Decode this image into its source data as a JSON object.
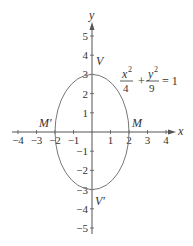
{
  "axes": {
    "x_label": "x",
    "y_label": "y",
    "x_ticks": [
      {
        "value": -4,
        "label": "−4"
      },
      {
        "value": -3,
        "label": "−3"
      },
      {
        "value": -2,
        "label": "−2"
      },
      {
        "value": -1,
        "label": "−1"
      },
      {
        "value": 1,
        "label": "1"
      },
      {
        "value": 2,
        "label": "2"
      },
      {
        "value": 3,
        "label": "3"
      },
      {
        "value": 4,
        "label": "4"
      }
    ],
    "y_ticks": [
      {
        "value": 5,
        "label": "5"
      },
      {
        "value": 4,
        "label": "4"
      },
      {
        "value": 3,
        "label": "3"
      },
      {
        "value": 2,
        "label": "2"
      },
      {
        "value": 1,
        "label": "1"
      },
      {
        "value": -1,
        "label": "−1"
      },
      {
        "value": -2,
        "label": "−2"
      },
      {
        "value": -3,
        "label": "−3"
      },
      {
        "value": -4,
        "label": "−4"
      },
      {
        "value": -5,
        "label": "−5"
      }
    ]
  },
  "ellipse": {
    "a": 2,
    "b": 3,
    "equation": {
      "x_num": "x",
      "x_den": "4",
      "plus": "+",
      "y_num": "y",
      "y_den": "9",
      "exp": "2",
      "rhs": "= 1"
    }
  },
  "points": {
    "V": {
      "label": "V",
      "x": 0,
      "y": 3
    },
    "V_prime": {
      "label": "V′",
      "x": 0,
      "y": -3
    },
    "M": {
      "label": "M",
      "x": 2,
      "y": 0
    },
    "M_prime": {
      "label": "M′",
      "x": -2,
      "y": 0
    }
  },
  "colors": {
    "axis": "#555555",
    "curve": "#777777",
    "text": "#333333"
  }
}
